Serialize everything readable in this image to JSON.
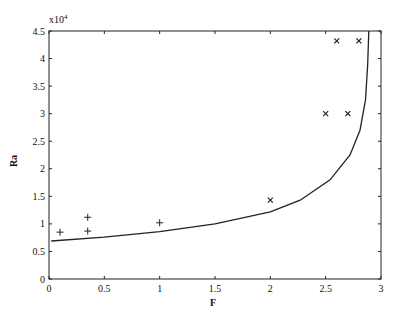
{
  "chart_data": {
    "type": "line",
    "title": "",
    "xlabel": "F",
    "ylabel": "Ra",
    "y_multiplier_label": "x10",
    "y_multiplier_exp": "4",
    "xlim": [
      0,
      3
    ],
    "ylim": [
      0,
      4.5
    ],
    "y_scale_note": "values in units of 10^4",
    "grid": false,
    "legend": null,
    "x_ticks": [
      "0",
      "0.5",
      "1",
      "1.5",
      "2",
      "2.5",
      "3"
    ],
    "y_ticks": [
      "0",
      "0.5",
      "1",
      "1.5",
      "2",
      "2.5",
      "3",
      "3.5",
      "4",
      "4.5"
    ],
    "series": [
      {
        "name": "curve",
        "style": "line",
        "x": [
          0.02,
          0.5,
          1.0,
          1.5,
          2.0,
          2.27,
          2.54,
          2.72,
          2.81,
          2.86,
          2.88,
          2.89
        ],
        "y": [
          0.69,
          0.76,
          0.86,
          1.0,
          1.22,
          1.43,
          1.8,
          2.25,
          2.7,
          3.25,
          3.9,
          4.5
        ]
      },
      {
        "name": "plus markers",
        "style": "marker-plus",
        "x": [
          0.1,
          0.35,
          0.35,
          1.0
        ],
        "y": [
          0.85,
          1.12,
          0.87,
          1.02
        ]
      },
      {
        "name": "cross markers",
        "style": "marker-x",
        "x": [
          2.0,
          2.5,
          2.7,
          2.6,
          2.8
        ],
        "y": [
          1.43,
          3.0,
          3.0,
          4.32,
          4.32
        ]
      }
    ]
  }
}
